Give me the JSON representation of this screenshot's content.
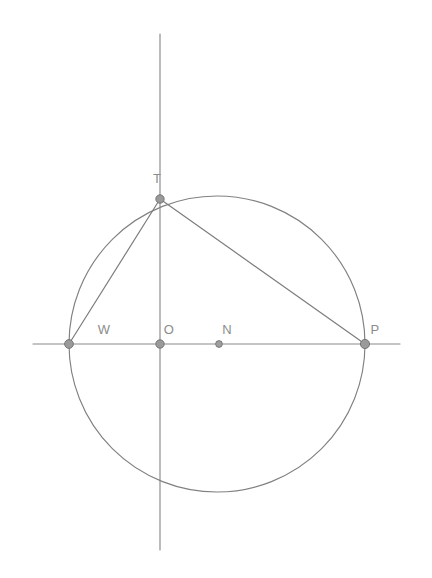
{
  "figure": {
    "background_color": "#ffffff",
    "stroke_color": "#8a8a8a",
    "label_color": "#8c8c8c",
    "canvas": {
      "width": 432,
      "height": 578
    }
  },
  "geometry": {
    "circle": {
      "cx": 217,
      "cy": 344,
      "r": 148
    },
    "vertical_line": {
      "x": 160,
      "y1": 34,
      "y2": 550
    },
    "horizontal_line": {
      "y": 344,
      "x1": 33,
      "x2": 400
    }
  },
  "points": [
    {
      "id": "T",
      "label": "T",
      "x": 160,
      "y": 199,
      "label_x": 157,
      "label_y": 183,
      "marker": "large"
    },
    {
      "id": "W",
      "label": "W",
      "x": 69,
      "y": 344,
      "label_x": 97,
      "label_y": 334,
      "marker": "large"
    },
    {
      "id": "O",
      "label": "O",
      "x": 160,
      "y": 344,
      "label_x": 164,
      "label_y": 334,
      "marker": "large"
    },
    {
      "id": "N",
      "label": "N",
      "x": 219,
      "y": 344,
      "label_x": 221,
      "label_y": 334,
      "marker": "small"
    },
    {
      "id": "P",
      "label": "P",
      "x": 365,
      "y": 344,
      "label_x": 370,
      "label_y": 334,
      "marker": "large"
    }
  ],
  "segments": [
    {
      "id": "TW",
      "from": "T",
      "to": "W"
    },
    {
      "id": "TP",
      "from": "T",
      "to": "P"
    }
  ]
}
